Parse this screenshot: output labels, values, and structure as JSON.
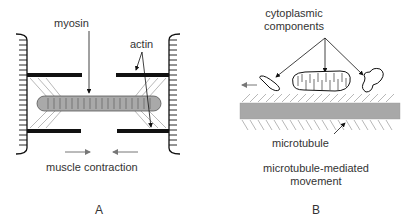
{
  "panel_a": {
    "label": "A",
    "labels": {
      "myosin": "myosin",
      "actin": "actin",
      "caption": "muscle contraction"
    }
  },
  "panel_b": {
    "label": "B",
    "labels": {
      "components_line1": "cytoplasmic",
      "components_line2": "components",
      "microtubule": "microtubule",
      "caption_line1": "microtubule-mediated",
      "caption_line2": "movement"
    }
  },
  "colors": {
    "ink": "#111111",
    "text": "#333333",
    "myosin_fill": "#a9a9a9",
    "microtubule_fill": "#a8a8a8",
    "arrow_gray": "#777777",
    "hatch": "#888888"
  }
}
